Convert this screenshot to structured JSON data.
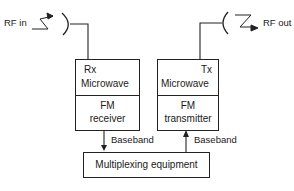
{
  "diagram": {
    "rf_in_label": "RF in",
    "rf_out_label": "RF out",
    "receiver_block": {
      "top": {
        "line1": "Rx",
        "line2": "Microwave"
      },
      "bottom": {
        "line1": "FM",
        "line2": "receiver"
      }
    },
    "transmitter_block": {
      "top": {
        "line1": "Tx",
        "line2": "Microwave"
      },
      "bottom": {
        "line1": "FM",
        "line2": "transmitter"
      }
    },
    "rx_baseband_label": "Baseband",
    "tx_baseband_label": "Baseband",
    "mux_label": "Multiplexing equipment",
    "icons": {
      "rx_antenna": "dish-antenna-icon",
      "tx_antenna": "dish-antenna-icon",
      "rf_in_wave": "lightning-arrow-icon",
      "rf_out_wave": "lightning-arrow-icon"
    }
  }
}
